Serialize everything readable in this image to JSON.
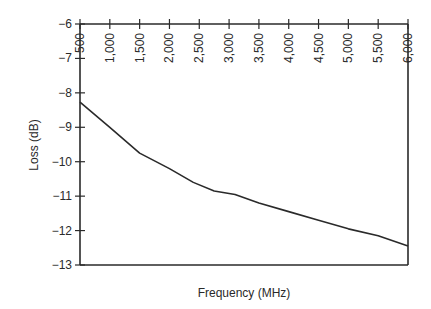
{
  "chart_data": {
    "type": "line",
    "title": "",
    "xlabel": "Frequency (MHz)",
    "ylabel": "Loss (dB)",
    "xlim": [
      500,
      6000
    ],
    "ylim": [
      -13,
      -6
    ],
    "x_ticks": [
      "500",
      "1,000",
      "1,500",
      "2,000",
      "2,500",
      "3,000",
      "3,500",
      "4,000",
      "4,500",
      "5,000",
      "5,500",
      "6,000"
    ],
    "x_tick_values": [
      500,
      1000,
      1500,
      2000,
      2500,
      3000,
      3500,
      4000,
      4500,
      5000,
      5500,
      6000
    ],
    "y_ticks": [
      "-6",
      "-7",
      "-8",
      "-9",
      "-10",
      "-11",
      "-12",
      "-13"
    ],
    "y_tick_values": [
      -6,
      -7,
      -8,
      -9,
      -10,
      -11,
      -12,
      -13
    ],
    "x_axis_position": "top",
    "grid": false,
    "legend": null,
    "series": [
      {
        "name": "Loss",
        "x": [
          500,
          1000,
          1500,
          2000,
          2400,
          2750,
          3100,
          3500,
          4000,
          4500,
          5000,
          5500,
          6000
        ],
        "values": [
          -8.27,
          -9.0,
          -9.75,
          -10.2,
          -10.6,
          -10.85,
          -10.95,
          -11.2,
          -11.45,
          -11.7,
          -11.95,
          -12.15,
          -12.45
        ]
      }
    ]
  },
  "colors": {
    "line": "#2a2a2a",
    "background": "#ffffff"
  }
}
